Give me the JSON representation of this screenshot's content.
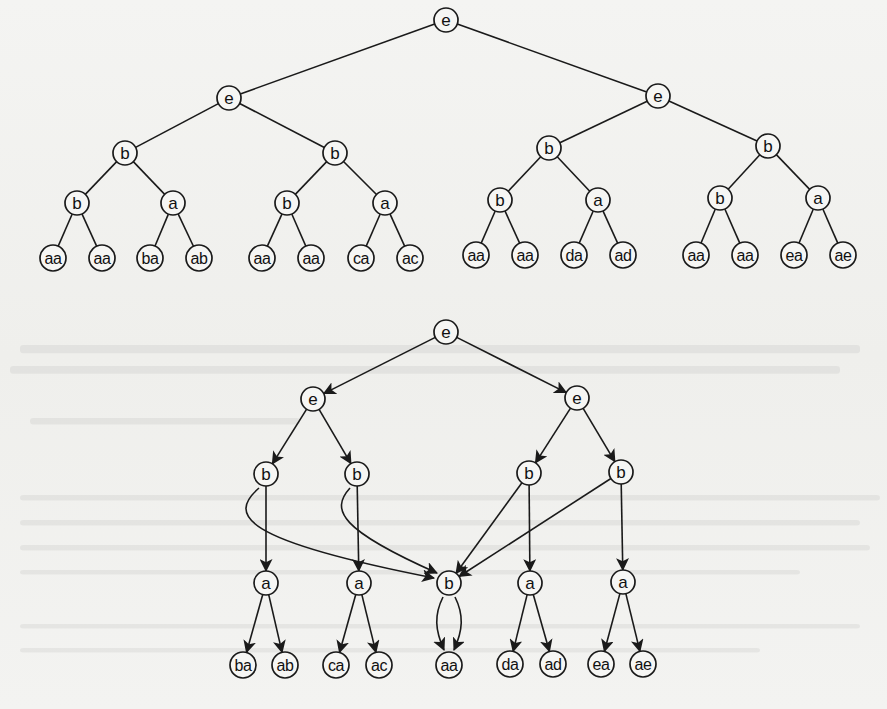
{
  "diagram": {
    "top_tree": {
      "kind": "binary-tree",
      "edges_directed": false,
      "nodes": [
        {
          "id": "t0",
          "label": "e",
          "x": 446,
          "y": 20
        },
        {
          "id": "t1",
          "label": "e",
          "x": 229,
          "y": 98
        },
        {
          "id": "t2",
          "label": "e",
          "x": 658,
          "y": 96
        },
        {
          "id": "t3",
          "label": "b",
          "x": 125,
          "y": 153
        },
        {
          "id": "t4",
          "label": "b",
          "x": 335,
          "y": 153
        },
        {
          "id": "t5",
          "label": "b",
          "x": 549,
          "y": 148
        },
        {
          "id": "t6",
          "label": "b",
          "x": 768,
          "y": 146
        },
        {
          "id": "t7",
          "label": "b",
          "x": 77,
          "y": 203
        },
        {
          "id": "t8",
          "label": "a",
          "x": 173,
          "y": 203
        },
        {
          "id": "t9",
          "label": "b",
          "x": 287,
          "y": 203
        },
        {
          "id": "t10",
          "label": "a",
          "x": 385,
          "y": 203
        },
        {
          "id": "t11",
          "label": "b",
          "x": 500,
          "y": 200
        },
        {
          "id": "t12",
          "label": "a",
          "x": 598,
          "y": 200
        },
        {
          "id": "t13",
          "label": "b",
          "x": 720,
          "y": 198
        },
        {
          "id": "t14",
          "label": "a",
          "x": 818,
          "y": 198
        },
        {
          "id": "t15",
          "label": "aa",
          "x": 53,
          "y": 258
        },
        {
          "id": "t16",
          "label": "aa",
          "x": 102,
          "y": 258
        },
        {
          "id": "t17",
          "label": "ba",
          "x": 150,
          "y": 258
        },
        {
          "id": "t18",
          "label": "ab",
          "x": 199,
          "y": 258
        },
        {
          "id": "t19",
          "label": "aa",
          "x": 262,
          "y": 258
        },
        {
          "id": "t20",
          "label": "aa",
          "x": 311,
          "y": 258
        },
        {
          "id": "t21",
          "label": "ca",
          "x": 361,
          "y": 258
        },
        {
          "id": "t22",
          "label": "ac",
          "x": 410,
          "y": 258
        },
        {
          "id": "t23",
          "label": "aa",
          "x": 476,
          "y": 255
        },
        {
          "id": "t24",
          "label": "aa",
          "x": 525,
          "y": 255
        },
        {
          "id": "t25",
          "label": "da",
          "x": 574,
          "y": 255
        },
        {
          "id": "t26",
          "label": "ad",
          "x": 623,
          "y": 255
        },
        {
          "id": "t27",
          "label": "aa",
          "x": 696,
          "y": 255
        },
        {
          "id": "t28",
          "label": "aa",
          "x": 745,
          "y": 255
        },
        {
          "id": "t29",
          "label": "ea",
          "x": 794,
          "y": 255
        },
        {
          "id": "t30",
          "label": "ae",
          "x": 843,
          "y": 255
        }
      ],
      "edges": [
        [
          "t0",
          "t1"
        ],
        [
          "t0",
          "t2"
        ],
        [
          "t1",
          "t3"
        ],
        [
          "t1",
          "t4"
        ],
        [
          "t2",
          "t5"
        ],
        [
          "t2",
          "t6"
        ],
        [
          "t3",
          "t7"
        ],
        [
          "t3",
          "t8"
        ],
        [
          "t4",
          "t9"
        ],
        [
          "t4",
          "t10"
        ],
        [
          "t5",
          "t11"
        ],
        [
          "t5",
          "t12"
        ],
        [
          "t6",
          "t13"
        ],
        [
          "t6",
          "t14"
        ],
        [
          "t7",
          "t15"
        ],
        [
          "t7",
          "t16"
        ],
        [
          "t8",
          "t17"
        ],
        [
          "t8",
          "t18"
        ],
        [
          "t9",
          "t19"
        ],
        [
          "t9",
          "t20"
        ],
        [
          "t10",
          "t21"
        ],
        [
          "t10",
          "t22"
        ],
        [
          "t11",
          "t23"
        ],
        [
          "t11",
          "t24"
        ],
        [
          "t12",
          "t25"
        ],
        [
          "t12",
          "t26"
        ],
        [
          "t13",
          "t27"
        ],
        [
          "t13",
          "t28"
        ],
        [
          "t14",
          "t29"
        ],
        [
          "t14",
          "t30"
        ]
      ]
    },
    "bottom_dag": {
      "kind": "directed-acyclic-graph",
      "edges_directed": true,
      "nodes": [
        {
          "id": "d0",
          "label": "e",
          "x": 446,
          "y": 332
        },
        {
          "id": "d1",
          "label": "e",
          "x": 313,
          "y": 399
        },
        {
          "id": "d2",
          "label": "e",
          "x": 577,
          "y": 398
        },
        {
          "id": "d3",
          "label": "b",
          "x": 266,
          "y": 474
        },
        {
          "id": "d4",
          "label": "b",
          "x": 357,
          "y": 474
        },
        {
          "id": "d5",
          "label": "b",
          "x": 529,
          "y": 473
        },
        {
          "id": "d6",
          "label": "b",
          "x": 621,
          "y": 472
        },
        {
          "id": "d7",
          "label": "a",
          "x": 266,
          "y": 583
        },
        {
          "id": "d8",
          "label": "a",
          "x": 359,
          "y": 583
        },
        {
          "id": "d9",
          "label": "b",
          "x": 449,
          "y": 583
        },
        {
          "id": "d10",
          "label": "a",
          "x": 530,
          "y": 583
        },
        {
          "id": "d11",
          "label": "a",
          "x": 623,
          "y": 582
        },
        {
          "id": "d12",
          "label": "ba",
          "x": 243,
          "y": 665
        },
        {
          "id": "d13",
          "label": "ab",
          "x": 285,
          "y": 665
        },
        {
          "id": "d14",
          "label": "ca",
          "x": 336,
          "y": 665
        },
        {
          "id": "d15",
          "label": "ac",
          "x": 379,
          "y": 665
        },
        {
          "id": "d16",
          "label": "aa",
          "x": 449,
          "y": 665
        },
        {
          "id": "d17",
          "label": "da",
          "x": 510,
          "y": 664
        },
        {
          "id": "d18",
          "label": "ad",
          "x": 553,
          "y": 664
        },
        {
          "id": "d19",
          "label": "ea",
          "x": 601,
          "y": 664
        },
        {
          "id": "d20",
          "label": "ae",
          "x": 643,
          "y": 664
        }
      ],
      "edges": [
        {
          "from": "d0",
          "to": "d1"
        },
        {
          "from": "d0",
          "to": "d2"
        },
        {
          "from": "d1",
          "to": "d3"
        },
        {
          "from": "d1",
          "to": "d4"
        },
        {
          "from": "d2",
          "to": "d5"
        },
        {
          "from": "d2",
          "to": "d6"
        },
        {
          "from": "d3",
          "to": "d7"
        },
        {
          "from": "d3",
          "to": "d9",
          "curve": "M 259 488 C 228 515, 240 540, 434 578"
        },
        {
          "from": "d4",
          "to": "d8"
        },
        {
          "from": "d4",
          "to": "d9",
          "curve": "M 350 488 C 330 510, 340 530, 437 573"
        },
        {
          "from": "d5",
          "to": "d10"
        },
        {
          "from": "d5",
          "to": "d9"
        },
        {
          "from": "d6",
          "to": "d11"
        },
        {
          "from": "d6",
          "to": "d9"
        },
        {
          "from": "d7",
          "to": "d12"
        },
        {
          "from": "d7",
          "to": "d13"
        },
        {
          "from": "d8",
          "to": "d14"
        },
        {
          "from": "d8",
          "to": "d15"
        },
        {
          "from": "d9",
          "to": "d16",
          "curve": "M 443 597 C 434 615, 435 630, 444 650"
        },
        {
          "from": "d9",
          "to": "d16",
          "curve": "M 455 597 C 464 615, 463 630, 454 650"
        },
        {
          "from": "d10",
          "to": "d17"
        },
        {
          "from": "d10",
          "to": "d18"
        },
        {
          "from": "d11",
          "to": "d19"
        },
        {
          "from": "d11",
          "to": "d20"
        }
      ]
    }
  },
  "style": {
    "ink": "#1a1a1a",
    "paper": "#f2f2f0",
    "node_radius": 12,
    "leaf_radius": 13
  }
}
